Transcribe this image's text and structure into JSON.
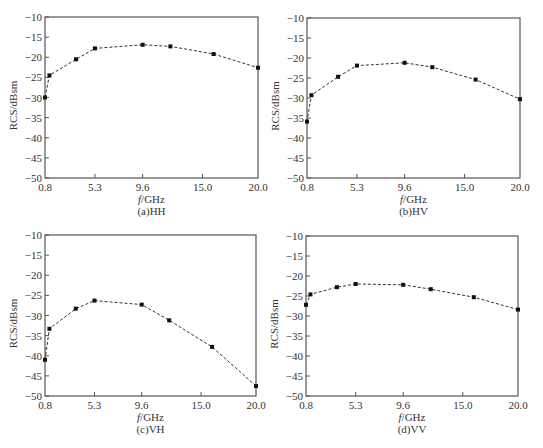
{
  "figure": {
    "ylabel": "RCS/dBsm",
    "xlabel_italic": "f",
    "xlabel_unit": "/GHz"
  },
  "chart_data": [
    {
      "type": "line",
      "title": "(a)HH",
      "xlabel": "f/GHz",
      "ylabel": "RCS/dBsm",
      "xlim": [
        0.8,
        20.0
      ],
      "ylim": [
        -50,
        -10
      ],
      "x_ticks": [
        "0.8",
        "5.3",
        "9.6",
        "15.0",
        "20.0"
      ],
      "y_ticks": [
        "-10",
        "-15",
        "-20",
        "-25",
        "-30",
        "-35",
        "-40",
        "-45",
        "-50"
      ],
      "grid": false,
      "line_style": "dashed",
      "marker": "square",
      "x": [
        0.8,
        1.2,
        3.6,
        5.3,
        9.6,
        12.1,
        16.0,
        20.0
      ],
      "values": [
        -30.0,
        -24.5,
        -20.5,
        -17.8,
        -16.9,
        -17.3,
        -19.2,
        -22.6
      ]
    },
    {
      "type": "line",
      "title": "(b)HV",
      "xlabel": "f/GHz",
      "ylabel": "RCS/dBsm",
      "xlim": [
        0.8,
        20.0
      ],
      "ylim": [
        -50,
        -10
      ],
      "x_ticks": [
        "0.8",
        "5.3",
        "9.6",
        "15.0",
        "20.0"
      ],
      "y_ticks": [
        "-10",
        "-15",
        "-20",
        "-25",
        "-30",
        "-35",
        "-40",
        "-45",
        "-50"
      ],
      "grid": false,
      "line_style": "dashed",
      "marker": "square",
      "x": [
        0.8,
        1.2,
        3.6,
        5.3,
        9.6,
        12.1,
        16.0,
        20.0
      ],
      "values": [
        -35.9,
        -29.3,
        -24.7,
        -21.9,
        -21.2,
        -22.3,
        -25.4,
        -30.3
      ]
    },
    {
      "type": "line",
      "title": "(c)VH",
      "xlabel": "f/GHz",
      "ylabel": "RCS/dBsm",
      "xlim": [
        0.8,
        20.0
      ],
      "ylim": [
        -50,
        -10
      ],
      "x_ticks": [
        "0.8",
        "5.3",
        "9.6",
        "15.0",
        "20.0"
      ],
      "y_ticks": [
        "-10",
        "-15",
        "-20",
        "-25",
        "-30",
        "-35",
        "-40",
        "-45",
        "-50"
      ],
      "grid": false,
      "line_style": "dashed",
      "marker": "square",
      "x": [
        0.8,
        1.2,
        3.6,
        5.3,
        9.6,
        12.1,
        16.0,
        20.0
      ],
      "values": [
        -41.0,
        -33.3,
        -28.3,
        -26.3,
        -27.3,
        -31.2,
        -37.8,
        -47.5
      ]
    },
    {
      "type": "line",
      "title": "(d)VV",
      "xlabel": "f/GHz",
      "ylabel": "RCS/dBsm",
      "xlim": [
        0.8,
        20.0
      ],
      "ylim": [
        -50,
        -10
      ],
      "x_ticks": [
        "0.8",
        "5.3",
        "9.6",
        "15.0",
        "20.0"
      ],
      "y_ticks": [
        "-10",
        "-15",
        "-20",
        "-25",
        "-30",
        "-35",
        "-40",
        "-45",
        "-50"
      ],
      "grid": false,
      "line_style": "dashed",
      "marker": "square",
      "x": [
        0.8,
        1.2,
        3.6,
        5.3,
        9.6,
        12.1,
        16.0,
        20.0
      ],
      "values": [
        -27.2,
        -24.6,
        -22.8,
        -22.0,
        -22.2,
        -23.3,
        -25.3,
        -28.4
      ]
    }
  ],
  "layout": {
    "panels": [
      {
        "left": 45,
        "top": 17,
        "width": 213,
        "height": 161
      },
      {
        "left": 307,
        "top": 18,
        "width": 213,
        "height": 160
      },
      {
        "left": 45,
        "top": 235,
        "width": 211,
        "height": 161
      },
      {
        "left": 306,
        "top": 236,
        "width": 212,
        "height": 160
      }
    ],
    "line_color": "#333333",
    "frame_color": "#555555"
  }
}
